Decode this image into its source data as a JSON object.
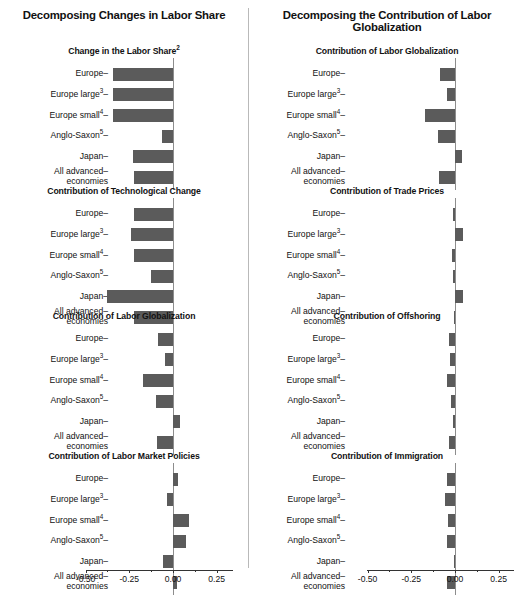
{
  "figure": {
    "left_column_title": "Decomposing Changes in Labor Share",
    "right_column_title": "Decomposing the Contribution of Labor Globalization",
    "bar_color": "#5b5b5b",
    "axis_color": "#333333",
    "zeroline_color": "#8d8d8d",
    "background": "#ffffff"
  },
  "categories": [
    {
      "label": "Europe",
      "sup": ""
    },
    {
      "label": "Europe large",
      "sup": "3"
    },
    {
      "label": "Europe small",
      "sup": "4"
    },
    {
      "label": "Anglo-Saxon",
      "sup": "5"
    },
    {
      "label": "Japan",
      "sup": ""
    },
    {
      "label": "All advanced economies",
      "sup": ""
    }
  ],
  "axis": {
    "ticks": [
      "-0.50",
      "-0.25",
      "0.00",
      "0.25"
    ],
    "tick_values": [
      -0.5,
      -0.25,
      0.0,
      0.25
    ],
    "minor_values": [
      -0.375,
      -0.125,
      0.125
    ],
    "min": -0.56,
    "max": 0.3
  },
  "chart_data": [
    {
      "type": "bar",
      "orientation": "horizontal",
      "title": "Change in the Labor Share",
      "title_sup": "2",
      "column": "left",
      "panel_index": 0,
      "categories": [
        "Europe",
        "Europe large",
        "Europe small",
        "Anglo-Saxon",
        "Japan",
        "All advanced economies"
      ],
      "values": [
        -0.345,
        -0.345,
        -0.345,
        -0.065,
        -0.23,
        -0.225
      ],
      "xlabel": "",
      "ylabel": "",
      "xlim": [
        -0.56,
        0.3
      ],
      "grid": false,
      "legend": "none"
    },
    {
      "type": "bar",
      "orientation": "horizontal",
      "title": "Contribution of Technological Change",
      "title_sup": "",
      "column": "left",
      "panel_index": 1,
      "categories": [
        "Europe",
        "Europe large",
        "Europe small",
        "Anglo-Saxon",
        "Japan",
        "All advanced economies"
      ],
      "values": [
        -0.225,
        -0.24,
        -0.225,
        -0.125,
        -0.375,
        -0.225
      ],
      "xlabel": "",
      "ylabel": "",
      "xlim": [
        -0.56,
        0.3
      ],
      "grid": false,
      "legend": "none"
    },
    {
      "type": "bar",
      "orientation": "horizontal",
      "title": "Contribution of Labor Globalization",
      "title_sup": "",
      "column": "left",
      "panel_index": 2,
      "categories": [
        "Europe",
        "Europe large",
        "Europe small",
        "Anglo-Saxon",
        "Japan",
        "All advanced economies"
      ],
      "values": [
        -0.085,
        -0.045,
        -0.17,
        -0.1,
        0.04,
        -0.09
      ],
      "xlabel": "",
      "ylabel": "",
      "xlim": [
        -0.56,
        0.3
      ],
      "grid": false,
      "legend": "none"
    },
    {
      "type": "bar",
      "orientation": "horizontal",
      "title": "Contribution of Labor Market Policies",
      "title_sup": "",
      "column": "left",
      "panel_index": 3,
      "categories": [
        "Europe",
        "Europe large",
        "Europe small",
        "Anglo-Saxon",
        "Japan",
        "All advanced economies"
      ],
      "values": [
        0.03,
        -0.035,
        0.09,
        0.075,
        -0.055,
        0.025
      ],
      "xlabel": "",
      "ylabel": "",
      "xlim": [
        -0.56,
        0.3
      ],
      "grid": false,
      "legend": "none"
    },
    {
      "type": "bar",
      "orientation": "horizontal",
      "title": "Contribution of Labor Globalization",
      "title_sup": "",
      "column": "right",
      "panel_index": 0,
      "categories": [
        "Europe",
        "Europe large",
        "Europe small",
        "Anglo-Saxon",
        "Japan",
        "All advanced economies"
      ],
      "values": [
        -0.085,
        -0.045,
        -0.17,
        -0.1,
        0.04,
        -0.09
      ],
      "xlabel": "",
      "ylabel": "",
      "xlim": [
        -0.56,
        0.3
      ],
      "grid": false,
      "legend": "none"
    },
    {
      "type": "bar",
      "orientation": "horizontal",
      "title": "Contribution of Trade Prices",
      "title_sup": "",
      "column": "right",
      "panel_index": 1,
      "categories": [
        "Europe",
        "Europe large",
        "Europe small",
        "Anglo-Saxon",
        "Japan",
        "All advanced economies"
      ],
      "values": [
        -0.01,
        0.048,
        -0.017,
        -0.012,
        0.048,
        -0.008
      ],
      "xlabel": "",
      "ylabel": "",
      "xlim": [
        -0.56,
        0.3
      ],
      "grid": false,
      "legend": "none"
    },
    {
      "type": "bar",
      "orientation": "horizontal",
      "title": "Contribution of Offshoring",
      "title_sup": "",
      "column": "right",
      "panel_index": 2,
      "categories": [
        "Europe",
        "Europe large",
        "Europe small",
        "Anglo-Saxon",
        "Japan",
        "All advanced economies"
      ],
      "values": [
        -0.037,
        -0.028,
        -0.046,
        -0.025,
        -0.012,
        -0.034
      ],
      "xlabel": "",
      "ylabel": "",
      "xlim": [
        -0.56,
        0.3
      ],
      "grid": false,
      "legend": "none"
    },
    {
      "type": "bar",
      "orientation": "horizontal",
      "title": "Contribution of Immigration",
      "title_sup": "",
      "column": "right",
      "panel_index": 3,
      "categories": [
        "Europe",
        "Europe large",
        "Europe small",
        "Anglo-Saxon",
        "Japan",
        "All advanced economies"
      ],
      "values": [
        -0.048,
        -0.058,
        -0.038,
        -0.048,
        -0.004,
        -0.045
      ],
      "xlabel": "",
      "ylabel": "",
      "xlim": [
        -0.56,
        0.3
      ],
      "grid": false,
      "legend": "none"
    }
  ]
}
